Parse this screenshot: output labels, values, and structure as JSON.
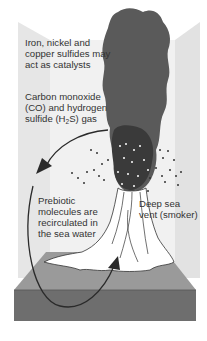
{
  "diagram": {
    "colors": {
      "background": "#ffffff",
      "back_wall_light": "#ebebeb",
      "back_wall_panel": "#e2e2e2",
      "plume": "#5a5a5a",
      "plume_dark": "#3a3a3a",
      "seafloor_top": "#9a9a9a",
      "seafloor_front": "#6e6e6e",
      "vent_body": "#ffffff",
      "arrow": "#2a2a2a",
      "text": "#333333"
    },
    "labels": {
      "catalysts": {
        "line1": "Iron, nickel and",
        "line2": "copper sulfides may",
        "line3": "act as catalysts"
      },
      "gas": {
        "line1": "Carbon monoxide",
        "line2": "(CO) and hydrogen",
        "line3_pre": "sulfide (H",
        "line3_sub": "2",
        "line3_post": "S) gas"
      },
      "prebiotic": {
        "line1": "Prebiotic",
        "line2": "molecules are",
        "line3": "recirculated in",
        "line4": "the sea water"
      },
      "vent": {
        "line1": "Deep sea",
        "line2": "vent (smoker)"
      }
    },
    "elements": [
      "smoke plume",
      "particle dots",
      "vent chimney",
      "seafloor block",
      "recirculation arrow"
    ]
  }
}
